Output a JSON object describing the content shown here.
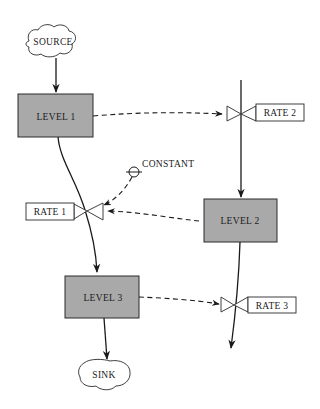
{
  "diagram": {
    "type": "system-dynamics stock-and-flow diagram",
    "source": {
      "label": "SOURCE"
    },
    "sink": {
      "label": "SINK"
    },
    "levels": [
      {
        "id": "level1",
        "label": "LEVEL 1"
      },
      {
        "id": "level2",
        "label": "LEVEL 2"
      },
      {
        "id": "level3",
        "label": "LEVEL 3"
      }
    ],
    "rates": [
      {
        "id": "rate1",
        "label": "RATE 1"
      },
      {
        "id": "rate2",
        "label": "RATE 2"
      },
      {
        "id": "rate3",
        "label": "RATE 3"
      }
    ],
    "constant": {
      "label": "CONSTANT"
    },
    "colors": {
      "level_fill": "#a9a9a9",
      "line": "#1a1a1a",
      "background": "#ffffff"
    }
  }
}
